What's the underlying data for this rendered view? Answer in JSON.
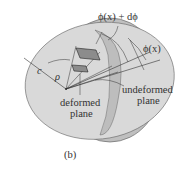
{
  "figure": {
    "caption": "(b)",
    "labels": {
      "phi_plus": "ϕ(x) + dϕ",
      "phi": "ϕ(x)",
      "radius_c": "c",
      "radius_rho": "ρ",
      "deformed_line1": "deformed",
      "deformed_line2": "plane",
      "undeformed_line1": "undeformed",
      "undeformed_line2": "plane"
    },
    "colors": {
      "disk_face": "#d9d9d9",
      "disk_rim": "#bfbfbf",
      "lines": "#333333",
      "element": "#8c8c8c"
    }
  }
}
